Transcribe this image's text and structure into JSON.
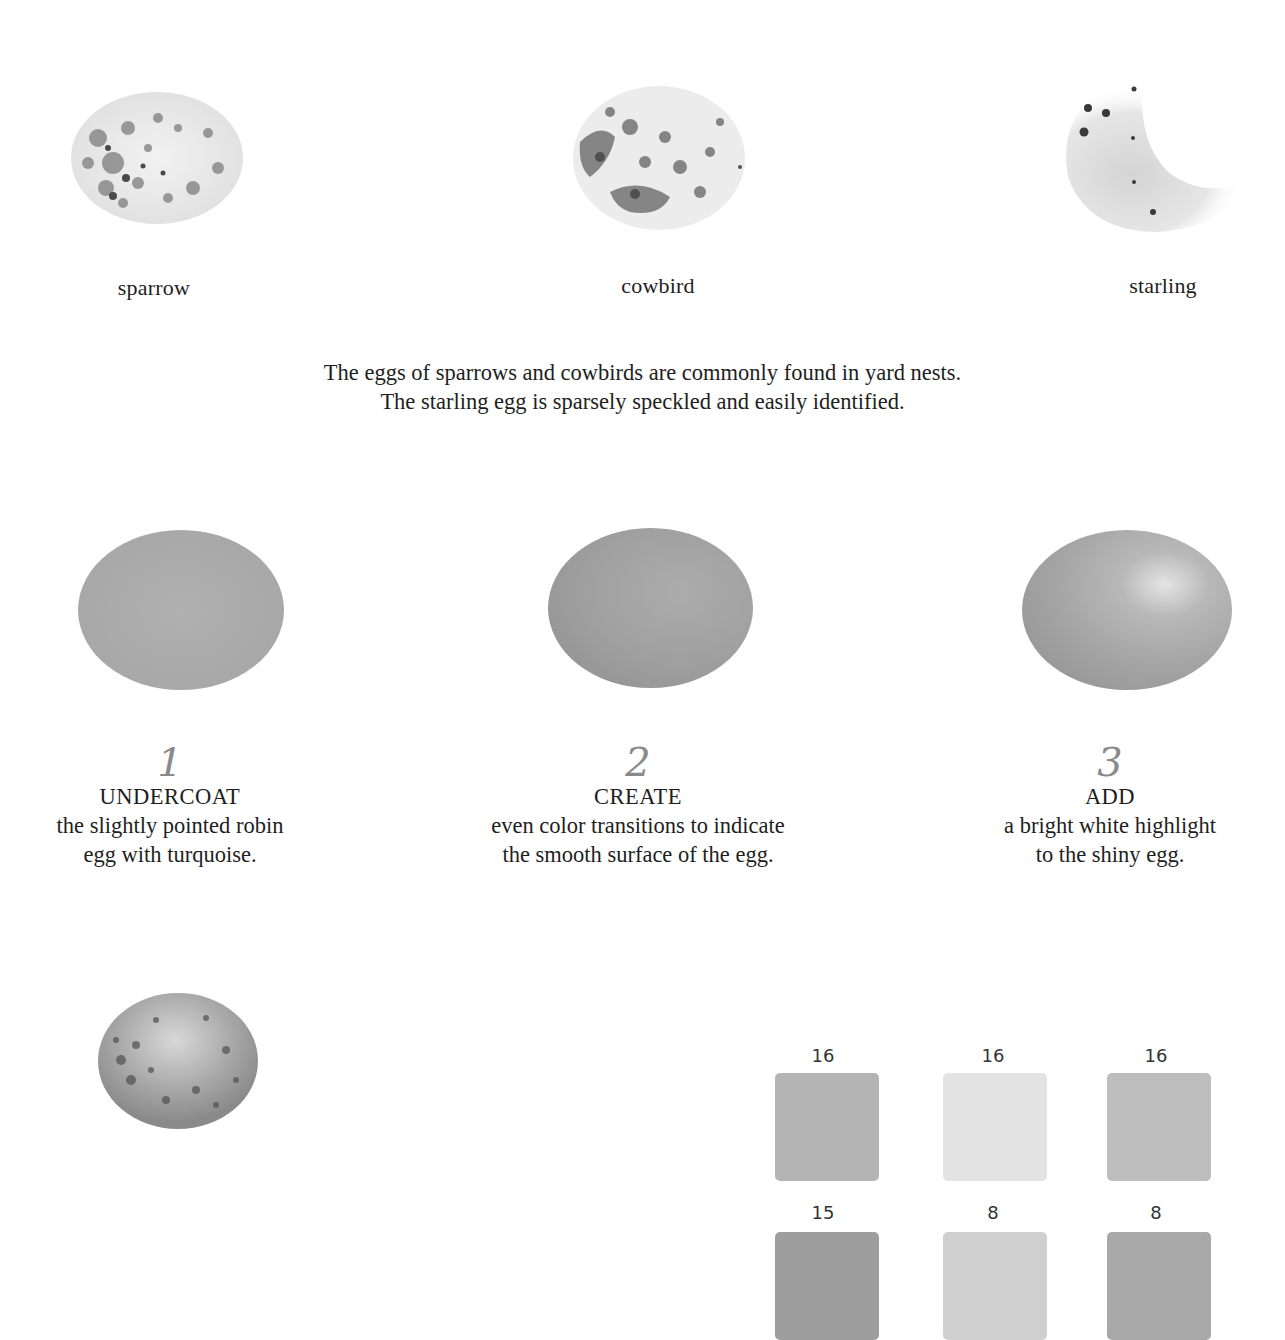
{
  "species": [
    {
      "label": "sparrow"
    },
    {
      "label": "cowbird"
    },
    {
      "label": "starling"
    }
  ],
  "caption": {
    "line1": "The eggs of sparrows and cowbirds are commonly found in yard nests.",
    "line2": "The starling egg is sparsely speckled and easily identified."
  },
  "steps": [
    {
      "number": "1",
      "heading": "UNDERCOAT",
      "line1": "the slightly pointed robin",
      "line2": "egg with turquoise."
    },
    {
      "number": "2",
      "heading": "CREATE",
      "line1": "even color transitions to indicate",
      "line2": "the smooth surface of the egg."
    },
    {
      "number": "3",
      "heading": "ADD",
      "line1": "a bright white highlight",
      "line2": "to the shiny egg."
    }
  ],
  "swatches": {
    "row1": [
      {
        "number": "16",
        "color": "#b4b4b4"
      },
      {
        "number": "16",
        "color": "#e3e3e3"
      },
      {
        "number": "16",
        "color": "#bdbdbd"
      }
    ],
    "row2": [
      {
        "number": "15",
        "color": "#9e9e9e"
      },
      {
        "number": "8",
        "color": "#cfcfcf"
      },
      {
        "number": "8",
        "color": "#a8a8a8"
      }
    ]
  }
}
